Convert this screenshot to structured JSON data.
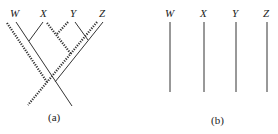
{
  "figure": {
    "panel_a": {
      "taxa": [
        "W",
        "X",
        "Y",
        "Z"
      ],
      "caption": "(a)",
      "description": "Gene tree (solid lines) embedded in species tree (dotted lines)"
    },
    "panel_b": {
      "taxa": [
        "W",
        "X",
        "Y",
        "Z"
      ],
      "caption": "(b)",
      "description": "Four unconnected vertical lineages"
    }
  }
}
